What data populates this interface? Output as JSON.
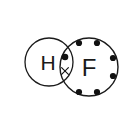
{
  "figure": {
    "title": "Lewis dot structure of hydrogen fluoride (HF)",
    "background_color": "#ffffff",
    "stroke_color": "#1a1a1a",
    "electron_color": "#111111",
    "width": 123,
    "height": 134
  },
  "atoms": [
    {
      "id": "hydrogen",
      "symbol": "H",
      "label_x": 48,
      "label_y": 62,
      "font_size": 21,
      "circle": {
        "cx": 49,
        "cy": 62,
        "r": 24,
        "stroke_width": 1.3
      }
    },
    {
      "id": "fluorine",
      "symbol": "F",
      "label_x": 89,
      "label_y": 67,
      "font_size": 24,
      "circle": {
        "cx": 89,
        "cy": 67,
        "r": 29,
        "stroke_width": 1.4
      }
    }
  ],
  "lone_pairs": {
    "owner": "fluorine",
    "count": 6,
    "dot_radius": 3.1,
    "dots": [
      {
        "name": "lone-pair-top-left",
        "cx": 79,
        "cy": 43
      },
      {
        "name": "lone-pair-top-right",
        "cx": 97,
        "cy": 43
      },
      {
        "name": "lone-pair-right-upper",
        "cx": 113,
        "cy": 58
      },
      {
        "name": "lone-pair-right-lower",
        "cx": 113,
        "cy": 76
      },
      {
        "name": "lone-pair-bottom-right",
        "cx": 97,
        "cy": 92
      },
      {
        "name": "lone-pair-bottom-left",
        "cx": 79,
        "cy": 92
      }
    ]
  },
  "bonding_pair": {
    "description": "Shared electron pair in the overlap region: dot from fluorine, cross from hydrogen",
    "dot": {
      "name": "bonding-electron-dot",
      "cx": 65,
      "cy": 57,
      "r": 3.3,
      "symbol": "dot"
    },
    "cross": {
      "name": "bonding-electron-cross",
      "cx": 65,
      "cy": 71,
      "size": 3.4,
      "symbol": "x"
    }
  }
}
